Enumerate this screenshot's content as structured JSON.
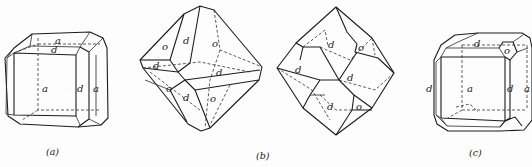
{
  "figure": {
    "panels": [
      {
        "id": "a",
        "caption": "(a)",
        "face_labels": [
          "a",
          "d",
          "a",
          "d",
          "a"
        ]
      },
      {
        "id": "b-left",
        "caption": "",
        "face_labels": [
          "o",
          "d",
          "o",
          "d",
          "d",
          "o",
          "d",
          "o"
        ]
      },
      {
        "id": "b-right",
        "caption": "(b)",
        "face_labels": [
          "d",
          "o",
          "d",
          "d",
          "d",
          "o"
        ]
      },
      {
        "id": "c",
        "caption": "(c)",
        "face_labels": [
          "d",
          "o",
          "d",
          "a",
          "d",
          "a"
        ]
      }
    ]
  },
  "colors": {
    "ink": "#1c1c1c",
    "paper": "#fdfdfd"
  }
}
